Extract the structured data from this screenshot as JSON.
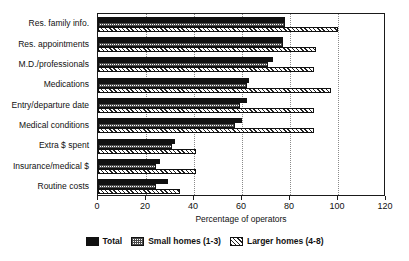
{
  "chart_data": {
    "type": "bar",
    "orientation": "horizontal",
    "title": "",
    "xlabel": "Percentage of operators",
    "ylabel": "",
    "xlim": [
      0,
      120
    ],
    "xticks": [
      0,
      20,
      40,
      60,
      80,
      100,
      120
    ],
    "grid": "vertical-dotted",
    "legend_position": "bottom-center",
    "categories": [
      "Res. family info.",
      "Res. appointments",
      "M.D./professionals",
      "Medications",
      "Entry/departure date",
      "Medical conditions",
      "Extra $ spent",
      "Insurance/medical $",
      "Routine costs"
    ],
    "series": [
      {
        "name": "Total",
        "pattern": "solid-black",
        "color": "#111111",
        "values": [
          78,
          77,
          73,
          63,
          62,
          60,
          32,
          26,
          29
        ]
      },
      {
        "name": "Small homes (1-3)",
        "pattern": "checkered-gray",
        "color": "#4a4a4a",
        "values": [
          78,
          77,
          71,
          62,
          59,
          57,
          31,
          24,
          24
        ]
      },
      {
        "name": "Larger homes (4-8)",
        "pattern": "diagonal-hatch",
        "color": "#222222",
        "values": [
          100,
          91,
          90,
          97,
          90,
          90,
          41,
          41,
          34
        ]
      }
    ]
  },
  "legend": {
    "items": [
      {
        "label": "Total"
      },
      {
        "label": "Small homes (1-3)"
      },
      {
        "label": "Larger homes (4-8)"
      }
    ]
  }
}
